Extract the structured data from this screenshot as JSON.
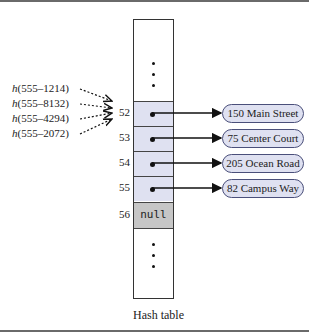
{
  "diagram": {
    "caption": "Hash table",
    "hash_calls": [
      {
        "fn": "h",
        "arg": "(555–1214)"
      },
      {
        "fn": "h",
        "arg": "(555–8132)"
      },
      {
        "fn": "h",
        "arg": "(555–4294)"
      },
      {
        "fn": "h",
        "arg": "(555–2072)"
      }
    ],
    "indices": [
      "52",
      "53",
      "54",
      "55",
      "56"
    ],
    "null_label": "null",
    "nodes": [
      "150 Main Street",
      "75 Center Court",
      "205 Ocean Road",
      "82 Campus Way"
    ],
    "colors": {
      "cell_fill": "#dfe1f1",
      "null_fill": "#c6c6c6",
      "node_border": "#4a4f7a"
    }
  }
}
